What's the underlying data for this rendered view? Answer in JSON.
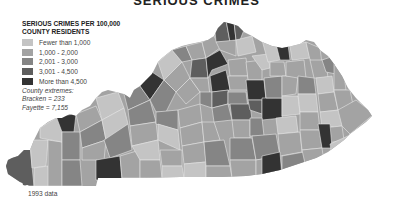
{
  "title": "SERIOUS CRIMES",
  "legend": {
    "title_line1": "SERIOUS CRIMES PER 100,000",
    "title_line2": "COUNTY RESIDENTS",
    "items": [
      {
        "label": "Fewer than 1,000",
        "color": "#c4c4c4"
      },
      {
        "label": "1,000 - 2,000",
        "color": "#a3a3a3"
      },
      {
        "label": "2,001 - 3,000",
        "color": "#858585"
      },
      {
        "label": "3,001 - 4,500",
        "color": "#5e5e5e"
      },
      {
        "label": "More than 4,500",
        "color": "#333333"
      }
    ]
  },
  "extremes": {
    "heading": "County extremes:",
    "low": "Bracken = 233",
    "high": "Fayette = 7,155"
  },
  "footnote": "1993 data",
  "map": {
    "region": "Kentucky",
    "border_color": "#e6e6e6"
  }
}
